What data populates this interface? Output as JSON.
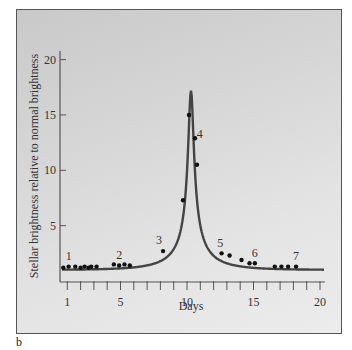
{
  "panel_label": "b",
  "chart_data": {
    "type": "line",
    "title": "",
    "xlabel": "Days",
    "ylabel": "Stellar brightness relative to normal brightness",
    "xlim": [
      0.5,
      20.5
    ],
    "ylim": [
      0,
      21
    ],
    "x_ticks": [
      1,
      5,
      10,
      15,
      20
    ],
    "x_minor_ticks": [
      1,
      2,
      3,
      4,
      5,
      6,
      7,
      8,
      9,
      10,
      11,
      12,
      13,
      14,
      15,
      16,
      17,
      18,
      19,
      20
    ],
    "y_ticks": [
      5,
      10,
      15,
      20
    ],
    "grid": false,
    "legend": null,
    "series": [
      {
        "name": "Observed brightness",
        "kind": "scatter",
        "x": [
          0.7,
          1.1,
          1.6,
          2.0,
          2.3,
          2.6,
          2.8,
          3.2,
          4.5,
          4.9,
          5.3,
          5.7,
          8.2,
          9.7,
          10.15,
          10.6,
          10.75,
          12.6,
          13.2,
          14.1,
          14.7,
          15.1,
          16.6,
          17.1,
          17.6,
          18.2
        ],
        "y": [
          1.2,
          1.3,
          1.3,
          1.2,
          1.3,
          1.2,
          1.3,
          1.3,
          1.5,
          1.4,
          1.5,
          1.4,
          2.7,
          7.3,
          15.0,
          12.9,
          10.5,
          2.5,
          2.3,
          1.9,
          1.6,
          1.6,
          1.3,
          1.3,
          1.3,
          1.3
        ]
      },
      {
        "name": "Microlensing model curve",
        "kind": "line",
        "peak_day": 10.3,
        "peak_value": 17.2,
        "baseline": 1.0,
        "x_range": [
          0.6,
          20.3
        ]
      }
    ],
    "annotations": [
      {
        "text": "1",
        "x": 1.1,
        "y": 1.9
      },
      {
        "text": "2",
        "x": 4.9,
        "y": 2.0
      },
      {
        "text": "3",
        "x": 7.9,
        "y": 3.3
      },
      {
        "text": "4",
        "x": 10.95,
        "y": 12.9
      },
      {
        "text": "5",
        "x": 12.5,
        "y": 3.1
      },
      {
        "text": "6",
        "x": 15.1,
        "y": 2.2
      },
      {
        "text": "7",
        "x": 18.2,
        "y": 1.9
      }
    ]
  }
}
